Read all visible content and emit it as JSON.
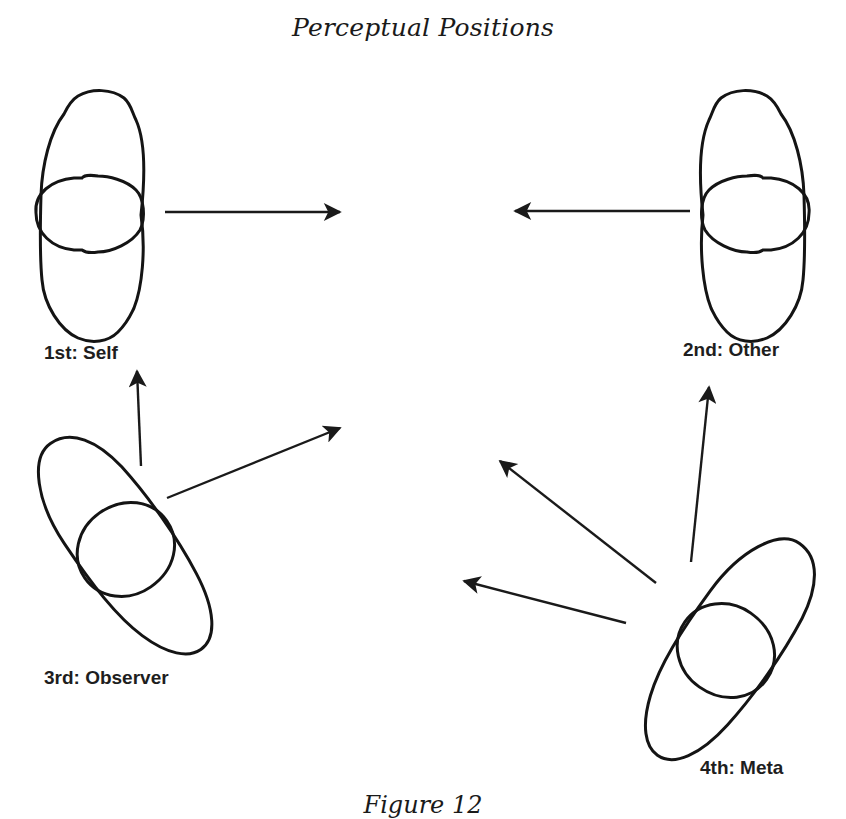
{
  "diagram": {
    "title": "Perceptual Positions",
    "caption": "Figure 12",
    "colors": {
      "background": "#ffffff",
      "ink": "#141414"
    },
    "positions": [
      {
        "id": "first",
        "label": "1st: Self",
        "orientation": "vertical",
        "facing": "right"
      },
      {
        "id": "second",
        "label": "2nd: Other",
        "orientation": "vertical",
        "facing": "left"
      },
      {
        "id": "third",
        "label": "3rd: Observer",
        "orientation": "tilted",
        "facing": "up-right"
      },
      {
        "id": "fourth",
        "label": "4th: Meta",
        "orientation": "tilted",
        "facing": "up-left"
      }
    ],
    "arrows": [
      {
        "from": "1st: Self",
        "direction": "right, toward center"
      },
      {
        "from": "2nd: Other",
        "direction": "left, toward center"
      },
      {
        "from": "3rd: Observer",
        "direction": "up, toward 1st: Self"
      },
      {
        "from": "3rd: Observer",
        "direction": "up-right, toward center"
      },
      {
        "from": "4th: Meta",
        "direction": "up-left, toward center"
      },
      {
        "from": "4th: Meta",
        "direction": "left, toward center"
      },
      {
        "from": "4th: Meta",
        "direction": "up, toward 2nd: Other"
      }
    ]
  }
}
